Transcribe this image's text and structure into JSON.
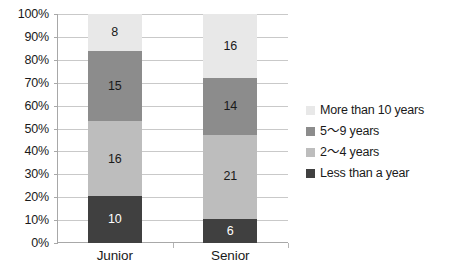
{
  "chart_data": {
    "type": "bar",
    "subtype": "100% stacked column",
    "title": "",
    "subtitle": "",
    "xlabel": "",
    "ylabel": "",
    "categories": [
      "Junior",
      "Senior"
    ],
    "series": [
      {
        "name": "Less than a year",
        "color": "#404040",
        "values": [
          10,
          6
        ]
      },
      {
        "name": "2～4 years",
        "color": "#bdbdbd",
        "values": [
          16,
          21
        ]
      },
      {
        "name": "5～9 years",
        "color": "#8c8c8c",
        "values": [
          15,
          14
        ]
      },
      {
        "name": "More than 10 years",
        "color": "#e8e8e8",
        "values": [
          8,
          16
        ]
      }
    ],
    "totals": [
      49,
      57
    ],
    "ylim": [
      0,
      100
    ],
    "y_tick_labels": [
      "0%",
      "10%",
      "20%",
      "30%",
      "40%",
      "50%",
      "60%",
      "70%",
      "80%",
      "90%",
      "100%"
    ],
    "y_tick_values": [
      0,
      10,
      20,
      30,
      40,
      50,
      60,
      70,
      80,
      90,
      100
    ],
    "grid": true,
    "legend_position": "right",
    "legend_order_top_to_bottom": [
      "More than 10 years",
      "5～9 years",
      "2～4 years",
      "Less than a year"
    ]
  },
  "axis": {
    "y_ticks": [
      {
        "label": "100%",
        "value": 100
      },
      {
        "label": "90%",
        "value": 90
      },
      {
        "label": "80%",
        "value": 80
      },
      {
        "label": "70%",
        "value": 70
      },
      {
        "label": "60%",
        "value": 60
      },
      {
        "label": "50%",
        "value": 50
      },
      {
        "label": "40%",
        "value": 40
      },
      {
        "label": "30%",
        "value": 30
      },
      {
        "label": "20%",
        "value": 20
      },
      {
        "label": "10%",
        "value": 10
      },
      {
        "label": "0%",
        "value": 0
      }
    ],
    "x_categories": [
      {
        "label": "Junior"
      },
      {
        "label": "Senior"
      }
    ]
  },
  "bars": [
    {
      "category": "Junior",
      "total": 49,
      "segments": [
        {
          "series": "More than 10 years",
          "value": 8,
          "label": "8",
          "color": "#e8e8e8",
          "text_color": "#1a1a1a"
        },
        {
          "series": "5～9 years",
          "value": 15,
          "label": "15",
          "color": "#8c8c8c",
          "text_color": "#1a1a1a"
        },
        {
          "series": "2～4 years",
          "value": 16,
          "label": "16",
          "color": "#bdbdbd",
          "text_color": "#1a1a1a"
        },
        {
          "series": "Less than a year",
          "value": 10,
          "label": "10",
          "color": "#404040",
          "text_color": "#ffffff"
        }
      ]
    },
    {
      "category": "Senior",
      "total": 57,
      "segments": [
        {
          "series": "More than 10 years",
          "value": 16,
          "label": "16",
          "color": "#e8e8e8",
          "text_color": "#1a1a1a"
        },
        {
          "series": "5～9 years",
          "value": 14,
          "label": "14",
          "color": "#8c8c8c",
          "text_color": "#1a1a1a"
        },
        {
          "series": "2～4 years",
          "value": 21,
          "label": "21",
          "color": "#bdbdbd",
          "text_color": "#1a1a1a"
        },
        {
          "series": "Less than a year",
          "value": 6,
          "label": "6",
          "color": "#404040",
          "text_color": "#ffffff"
        }
      ]
    }
  ],
  "legend": {
    "items": [
      {
        "label": "More than 10 years",
        "color": "#e8e8e8"
      },
      {
        "label": "5～9 years",
        "color": "#8c8c8c"
      },
      {
        "label": "2～4 years",
        "color": "#bdbdbd"
      },
      {
        "label": "Less than a year",
        "color": "#404040"
      }
    ]
  },
  "style": {
    "background": "#ffffff",
    "gridline_color": "#c9c9c9",
    "axis_color": "#a8a8a8",
    "text_color": "#1a1a1a"
  }
}
